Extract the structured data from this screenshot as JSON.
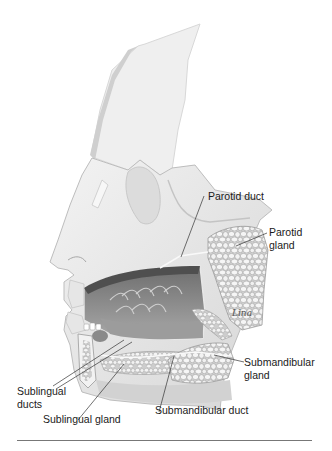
{
  "diagram": {
    "labels": {
      "parotid_duct": "Parotid duct",
      "parotid_gland_line1": "Parotid",
      "parotid_gland_line2": "gland",
      "submandibular_gland_line1": "Submandibular",
      "submandibular_gland_line2": "gland",
      "sublingual_ducts_line1": "Sublingual",
      "sublingual_ducts_line2": "ducts",
      "sublingual_gland": "Sublingual gland",
      "submandibular_duct": "Submandibular duct"
    },
    "signature": "Lina",
    "colors": {
      "skin": "#e9e9e9",
      "skin_shadow": "#cfcfcf",
      "gland": "#f3f3f3",
      "gland_outline": "#9a9a9a",
      "mouth": "#8e8e8e",
      "leader_line": "#333333",
      "rule": "#777777"
    }
  }
}
